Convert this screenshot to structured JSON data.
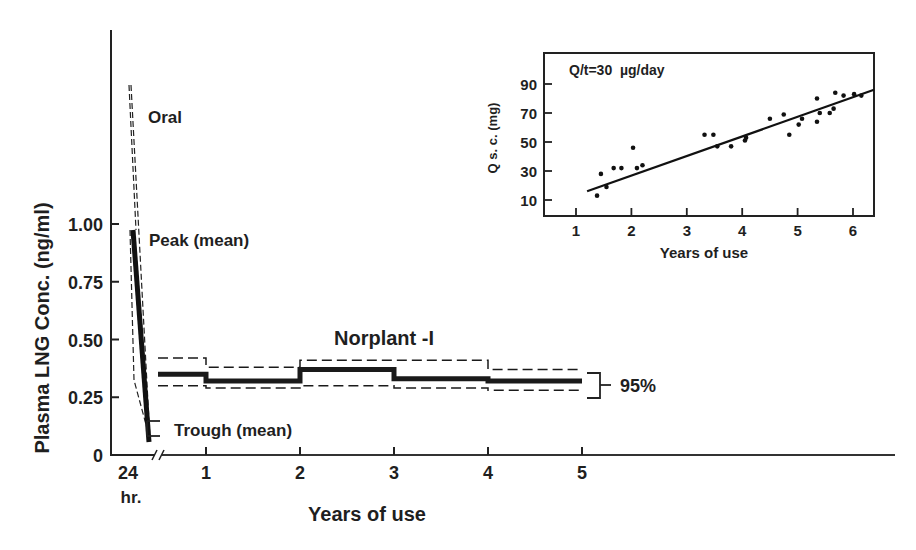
{
  "chart_data": [
    {
      "id": "main",
      "type": "line",
      "title": "Norplant -I",
      "xlabel": "Years of use",
      "ylabel": "Plasma LNG Conc. (ng/ml)",
      "y_ticks": [
        "0",
        "0.25",
        "0.50",
        "0.75",
        "1.00"
      ],
      "y_tick_values": [
        0,
        0.25,
        0.5,
        0.75,
        1.0
      ],
      "x_ticks": [
        "24",
        "1",
        "2",
        "3",
        "4",
        "5"
      ],
      "x_tick_sublabel": "hr.",
      "axis_break": true,
      "ylim": [
        0,
        1.6
      ],
      "annotations": {
        "oral": "Oral",
        "peak": "Peak (mean)",
        "trough": "Trough (mean)",
        "ci": "95%"
      },
      "oral_24hr": {
        "peak_mean": 0.95,
        "trough_mean": 0.1,
        "peak_upper": 1.55,
        "trough_upper": 0.13
      },
      "series": [
        {
          "name": "Mean",
          "style": "solid-thick",
          "intervals": [
            [
              0,
              1
            ],
            [
              1,
              2
            ],
            [
              2,
              3
            ],
            [
              3,
              4
            ],
            [
              4,
              5
            ]
          ],
          "values": [
            0.35,
            0.32,
            0.37,
            0.33,
            0.32
          ]
        },
        {
          "name": "95% CI upper",
          "style": "dashed",
          "intervals": [
            [
              0,
              1
            ],
            [
              1,
              2
            ],
            [
              2,
              3
            ],
            [
              3,
              4
            ],
            [
              4,
              5
            ]
          ],
          "values": [
            0.42,
            0.38,
            0.41,
            0.41,
            0.37
          ]
        },
        {
          "name": "95% CI lower",
          "style": "dashed",
          "intervals": [
            [
              0,
              1
            ],
            [
              1,
              2
            ],
            [
              2,
              3
            ],
            [
              3,
              4
            ],
            [
              4,
              5
            ]
          ],
          "values": [
            0.3,
            0.29,
            0.3,
            0.29,
            0.28
          ]
        }
      ],
      "grid": false,
      "legend": "none"
    },
    {
      "id": "inset",
      "type": "scatter",
      "title": "Q/t=30  µg/day",
      "xlabel": "Years of use",
      "ylabel": "Q s. c. (mg)",
      "x_ticks": [
        "1",
        "2",
        "3",
        "4",
        "5",
        "6"
      ],
      "y_ticks": [
        "10",
        "30",
        "50",
        "70",
        "90"
      ],
      "xlim": [
        0.45,
        6.4
      ],
      "ylim": [
        0,
        105
      ],
      "points": [
        [
          1.38,
          13
        ],
        [
          1.45,
          28
        ],
        [
          1.55,
          19
        ],
        [
          1.68,
          32
        ],
        [
          1.82,
          32
        ],
        [
          2.03,
          46
        ],
        [
          2.1,
          32
        ],
        [
          2.2,
          34
        ],
        [
          3.32,
          55
        ],
        [
          3.48,
          55
        ],
        [
          3.55,
          47
        ],
        [
          3.8,
          47
        ],
        [
          4.05,
          51
        ],
        [
          4.07,
          53
        ],
        [
          4.5,
          66
        ],
        [
          4.75,
          69
        ],
        [
          4.85,
          55
        ],
        [
          5.02,
          62
        ],
        [
          5.08,
          66
        ],
        [
          5.35,
          64
        ],
        [
          5.35,
          80
        ],
        [
          5.4,
          70
        ],
        [
          5.58,
          70
        ],
        [
          5.65,
          73
        ],
        [
          5.68,
          84
        ],
        [
          5.83,
          82
        ],
        [
          6.02,
          83
        ],
        [
          6.15,
          82
        ]
      ],
      "regression_line": {
        "x": [
          1.2,
          6.4
        ],
        "y": [
          16,
          86
        ]
      },
      "grid": false
    }
  ]
}
